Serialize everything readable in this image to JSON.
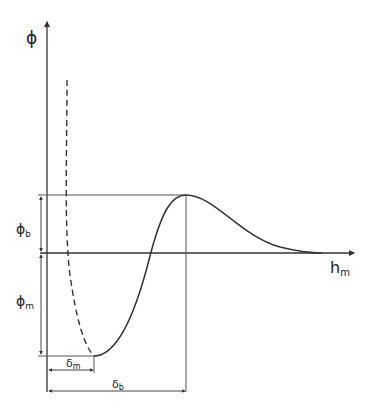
{
  "diagram": {
    "type": "potential-energy-curve",
    "axes": {
      "y_label": "ϕ",
      "x_label": "h",
      "x_label_sub": "m"
    },
    "dimensions": {
      "phi_b": {
        "label": "ϕ",
        "sub": "b"
      },
      "phi_m": {
        "label": "ϕ",
        "sub": "m"
      },
      "delta_m": {
        "label": "δ",
        "sub": "m"
      },
      "delta_b": {
        "label": "δ",
        "sub": "b"
      }
    },
    "curves": [
      {
        "name": "attractive-repulsive-dashed",
        "style": "dashed"
      },
      {
        "name": "total-interaction-solid",
        "style": "solid"
      }
    ],
    "colors": {
      "line": "#333333",
      "thin": "#555555",
      "background": "#ffffff"
    }
  }
}
